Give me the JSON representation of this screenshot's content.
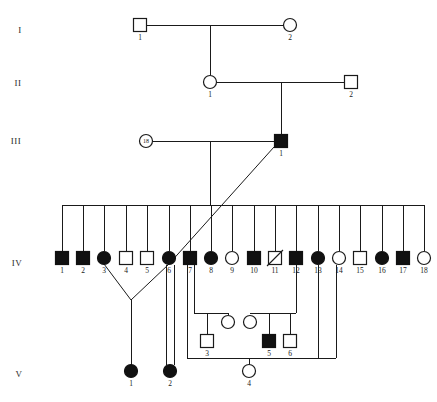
{
  "figure": {
    "background_color": "#ffffff",
    "line_color": "#1a1a1a",
    "affected_fill": "#111111",
    "unaffected_fill": "#ffffff"
  },
  "generation_labels": [
    {
      "name": "generation-label-i",
      "text": "I",
      "x": 20,
      "y": 33
    },
    {
      "name": "generation-label-ii",
      "text": "II",
      "x": 18,
      "y": 86
    },
    {
      "name": "generation-label-iii",
      "text": "III",
      "x": 16,
      "y": 144
    },
    {
      "name": "generation-label-iv",
      "text": "IV",
      "x": 17,
      "y": 266
    },
    {
      "name": "generation-label-v",
      "text": "V",
      "x": 19,
      "y": 377
    }
  ],
  "individuals": [
    {
      "id": "I-1",
      "gen": "I",
      "num": "1",
      "shape": "square",
      "status": "unaffected",
      "x": 140,
      "y": 25
    },
    {
      "id": "I-2",
      "gen": "I",
      "num": "2",
      "shape": "circle",
      "status": "unaffected",
      "x": 290,
      "y": 25
    },
    {
      "id": "II-1",
      "gen": "II",
      "num": "1",
      "shape": "circle",
      "status": "unaffected",
      "x": 210,
      "y": 82
    },
    {
      "id": "II-2",
      "gen": "II",
      "num": "2",
      "shape": "square",
      "status": "unaffected",
      "x": 351,
      "y": 82
    },
    {
      "id": "III-18",
      "gen": "III",
      "num": "",
      "shape": "circle",
      "status": "unaffected",
      "x": 146,
      "y": 141,
      "count": "18",
      "multiple": true
    },
    {
      "id": "III-1",
      "gen": "III",
      "num": "1",
      "shape": "square",
      "status": "affected",
      "x": 281,
      "y": 141
    },
    {
      "id": "IV-1",
      "gen": "IV",
      "num": "1",
      "shape": "square",
      "status": "affected",
      "x": 62,
      "y": 258
    },
    {
      "id": "IV-2",
      "gen": "IV",
      "num": "2",
      "shape": "square",
      "status": "affected",
      "x": 83,
      "y": 258
    },
    {
      "id": "IV-3",
      "gen": "IV",
      "num": "3",
      "shape": "circle",
      "status": "affected",
      "x": 104,
      "y": 258
    },
    {
      "id": "IV-4",
      "gen": "IV",
      "num": "4",
      "shape": "square",
      "status": "unaffected",
      "x": 126,
      "y": 258
    },
    {
      "id": "IV-5",
      "gen": "IV",
      "num": "5",
      "shape": "square",
      "status": "unaffected",
      "x": 147,
      "y": 258
    },
    {
      "id": "IV-6",
      "gen": "IV",
      "num": "6",
      "shape": "circle",
      "status": "affected",
      "x": 169,
      "y": 258
    },
    {
      "id": "IV-7",
      "gen": "IV",
      "num": "7",
      "shape": "square",
      "status": "affected",
      "x": 190,
      "y": 258
    },
    {
      "id": "IV-8",
      "gen": "IV",
      "num": "8",
      "shape": "circle",
      "status": "affected",
      "x": 211,
      "y": 258
    },
    {
      "id": "IV-9",
      "gen": "IV",
      "num": "9",
      "shape": "circle",
      "status": "unaffected",
      "x": 232,
      "y": 258
    },
    {
      "id": "IV-10",
      "gen": "IV",
      "num": "10",
      "shape": "square",
      "status": "affected",
      "x": 254,
      "y": 258
    },
    {
      "id": "IV-11",
      "gen": "IV",
      "num": "11",
      "shape": "square",
      "status": "deceased",
      "x": 275,
      "y": 258
    },
    {
      "id": "IV-12",
      "gen": "IV",
      "num": "12",
      "shape": "square",
      "status": "affected",
      "x": 296,
      "y": 258
    },
    {
      "id": "IV-13",
      "gen": "IV",
      "num": "13",
      "shape": "circle",
      "status": "affected",
      "x": 318,
      "y": 258
    },
    {
      "id": "IV-14",
      "gen": "IV",
      "num": "14",
      "shape": "circle",
      "status": "unaffected",
      "x": 339,
      "y": 258
    },
    {
      "id": "IV-15",
      "gen": "IV",
      "num": "15",
      "shape": "square",
      "status": "unaffected",
      "x": 360,
      "y": 258
    },
    {
      "id": "IV-16",
      "gen": "IV",
      "num": "16",
      "shape": "circle",
      "status": "affected",
      "x": 382,
      "y": 258
    },
    {
      "id": "IV-17",
      "gen": "IV",
      "num": "17",
      "shape": "square",
      "status": "affected",
      "x": 403,
      "y": 258
    },
    {
      "id": "IV-18",
      "gen": "IV",
      "num": "18",
      "shape": "circle",
      "status": "unaffected",
      "x": 424,
      "y": 258
    },
    {
      "id": "X-s1",
      "gen": "IVb",
      "num": "",
      "shape": "circle",
      "status": "unaffected",
      "x": 228,
      "y": 322
    },
    {
      "id": "X-3",
      "gen": "IVb",
      "num": "3",
      "shape": "square",
      "status": "unaffected",
      "x": 207,
      "y": 341
    },
    {
      "id": "X-s2",
      "gen": "IVb",
      "num": "",
      "shape": "circle",
      "status": "unaffected",
      "x": 250,
      "y": 322
    },
    {
      "id": "X-5",
      "gen": "IVb",
      "num": "5",
      "shape": "square",
      "status": "affected",
      "x": 269,
      "y": 341
    },
    {
      "id": "X-6",
      "gen": "IVb",
      "num": "6",
      "shape": "square",
      "status": "unaffected",
      "x": 290,
      "y": 341
    },
    {
      "id": "V-1",
      "gen": "V",
      "num": "1",
      "shape": "circle",
      "status": "affected",
      "x": 131,
      "y": 371
    },
    {
      "id": "V-2",
      "gen": "V",
      "num": "2",
      "shape": "circle",
      "status": "affected",
      "x": 170,
      "y": 371
    },
    {
      "id": "V-4",
      "gen": "V",
      "num": "4",
      "shape": "circle",
      "status": "unaffected",
      "x": 249,
      "y": 371
    }
  ],
  "connections": {
    "description": "Mating lines, sibship lines and descent lines of the pedigree",
    "segments": [
      {
        "name": "mating-line-i",
        "d": "M 147 25 L 283 25"
      },
      {
        "name": "descent-i-to-ii",
        "d": "M 210 25 L 210 75"
      },
      {
        "name": "mating-line-ii",
        "d": "M 217 82 L 344 82"
      },
      {
        "name": "descent-ii-to-iii",
        "d": "M 281 82 L 281 134"
      },
      {
        "name": "mating-line-iii",
        "d": "M 153 141 L 274 141"
      },
      {
        "name": "descent-iii-to-sibship",
        "d": "M 210 141 L 210 205"
      },
      {
        "name": "sibship-line-iv",
        "d": "M 62 205 L 424 205"
      },
      {
        "name": "drop-iv-1",
        "d": "M 62 205 L 62 251"
      },
      {
        "name": "drop-iv-2",
        "d": "M 83 205 L 83 251"
      },
      {
        "name": "drop-iv-3",
        "d": "M 104 205 L 104 251"
      },
      {
        "name": "drop-iv-4",
        "d": "M 126 205 L 126 251"
      },
      {
        "name": "drop-iv-5",
        "d": "M 147 205 L 147 251"
      },
      {
        "name": "drop-iv-6",
        "d": "M 169 205 L 169 251"
      },
      {
        "name": "drop-iv-7",
        "d": "M 190 205 L 190 251"
      },
      {
        "name": "drop-iv-8",
        "d": "M 211 205 L 211 251"
      },
      {
        "name": "drop-iv-9",
        "d": "M 232 205 L 232 251"
      },
      {
        "name": "drop-iv-10",
        "d": "M 254 205 L 254 251"
      },
      {
        "name": "drop-iv-11",
        "d": "M 275 205 L 275 251"
      },
      {
        "name": "drop-iv-12",
        "d": "M 296 205 L 296 251"
      },
      {
        "name": "drop-iv-13",
        "d": "M 318 205 L 318 251"
      },
      {
        "name": "drop-iv-14",
        "d": "M 339 205 L 339 251"
      },
      {
        "name": "drop-iv-15",
        "d": "M 360 205 L 360 251"
      },
      {
        "name": "drop-iv-16",
        "d": "M 382 205 L 382 251"
      },
      {
        "name": "drop-iv-17",
        "d": "M 403 205 L 403 251"
      },
      {
        "name": "drop-iv-18",
        "d": "M 424 205 L 424 251"
      },
      {
        "name": "consang-line-iii1-to-iv6",
        "d": "M 274 147 L 169 264"
      },
      {
        "name": "union-iv3-apex",
        "d": "M 104 264 L 131 300"
      },
      {
        "name": "union-iv6-apex",
        "d": "M 169 264 L 131 300"
      },
      {
        "name": "descent-to-v1",
        "d": "M 131 300 L 131 365"
      },
      {
        "name": "descent-iv6-to-v2-left",
        "d": "M 166 265 L 166 365"
      },
      {
        "name": "descent-iv7-to-v2-right",
        "d": "M 174 265 L 174 365"
      },
      {
        "name": "iv7-down-to-lower-box",
        "d": "M 187 265 L 187 358"
      },
      {
        "name": "lower-box-top-left",
        "d": "M 187 358 L 336 358"
      },
      {
        "name": "iv7-branch-to-x3-union",
        "d": "M 194 265 L 194 313"
      },
      {
        "name": "x3-union-horizontal",
        "d": "M 194 313 L 228 313"
      },
      {
        "name": "x3-union-drop",
        "d": "M 207 313 L 207 334"
      },
      {
        "name": "x3-spouse-drop",
        "d": "M 228 315 L 228 313"
      },
      {
        "name": "iv12-down",
        "d": "M 296 265 L 296 313"
      },
      {
        "name": "x5-union-horizontal",
        "d": "M 250 313 L 296 313"
      },
      {
        "name": "x5-drop",
        "d": "M 269 313 L 269 334"
      },
      {
        "name": "x6-drop",
        "d": "M 290 313 L 290 334"
      },
      {
        "name": "iv13-down-right",
        "d": "M 318 265 L 318 358"
      },
      {
        "name": "lower-box-right",
        "d": "M 336 358 L 336 265"
      },
      {
        "name": "descent-to-v4",
        "d": "M 249 358 L 249 365"
      }
    ]
  },
  "legend_note": ""
}
